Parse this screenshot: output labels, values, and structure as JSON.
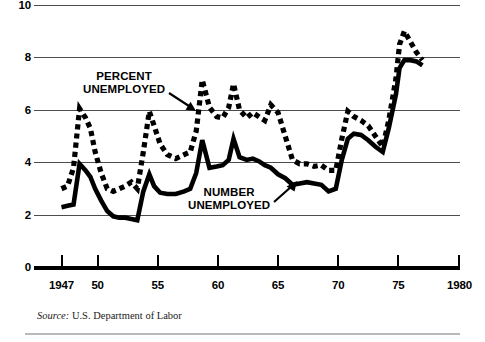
{
  "chart_data": {
    "type": "line",
    "title": "",
    "subtitle": "",
    "xlabel": "",
    "ylabel": "",
    "xlim": [
      1947,
      1980
    ],
    "ylim": [
      0,
      10
    ],
    "grid": true,
    "legend_position": "inline-annotations",
    "y_ticks": [
      10,
      8,
      6,
      4,
      2,
      0
    ],
    "y_tick_labels": [
      "10",
      "8",
      "6",
      "4",
      "2",
      "0"
    ],
    "x_ticks": [
      1947,
      1950,
      1955,
      1960,
      1965,
      1970,
      1975,
      1980
    ],
    "x_tick_labels": [
      "1947",
      "50",
      "55",
      "60",
      "65",
      "70",
      "75",
      "1980"
    ],
    "annotations": [
      {
        "text": "PERCENT UNEMPLOYED",
        "target_series": "PERCENT UNEMPLOYED",
        "arrow": "down-right"
      },
      {
        "text": "NUMBER UNEMPLOYED",
        "target_series": "NUMBER UNEMPLOYED",
        "arrow": "up-right"
      }
    ],
    "source": "U.S. Department of Labor",
    "x": [
      1947.0,
      1947.5,
      1948.0,
      1948.5,
      1949.0,
      1949.4,
      1949.8,
      1950.3,
      1950.8,
      1951.3,
      1951.8,
      1952.3,
      1952.8,
      1953.3,
      1953.8,
      1954.3,
      1954.7,
      1955.2,
      1955.8,
      1956.5,
      1957.2,
      1957.7,
      1958.2,
      1958.7,
      1959.3,
      1959.9,
      1960.4,
      1960.9,
      1961.3,
      1961.8,
      1962.4,
      1962.9,
      1963.4,
      1963.9,
      1964.4,
      1965.0,
      1965.6,
      1966.2,
      1966.8,
      1967.4,
      1968.0,
      1968.6,
      1969.2,
      1969.8,
      1970.3,
      1970.8,
      1971.3,
      1971.9,
      1972.5,
      1973.1,
      1973.7,
      1974.2,
      1974.8,
      1975.1,
      1975.5,
      1976.0,
      1976.5,
      1977.0
    ],
    "series": [
      {
        "name": "PERCENT UNEMPLOYED",
        "style": "dashed-heavy",
        "color": "#000000",
        "values": [
          3.0,
          3.1,
          3.8,
          6.05,
          5.7,
          5.3,
          4.4,
          3.6,
          3.0,
          2.9,
          3.0,
          3.1,
          3.25,
          3.0,
          4.4,
          5.95,
          5.4,
          4.7,
          4.3,
          4.15,
          4.3,
          4.4,
          5.2,
          7.15,
          6.1,
          5.75,
          5.7,
          6.1,
          7.0,
          6.0,
          5.7,
          5.9,
          5.75,
          5.6,
          6.2,
          5.9,
          5.0,
          4.1,
          3.95,
          3.95,
          3.85,
          3.9,
          3.7,
          3.7,
          4.9,
          5.95,
          5.75,
          5.6,
          5.4,
          5.0,
          4.6,
          5.6,
          7.2,
          8.5,
          9.0,
          8.6,
          8.2,
          7.9
        ]
      },
      {
        "name": "NUMBER UNEMPLOYED",
        "style": "solid-heavy",
        "color": "#000000",
        "values": [
          2.3,
          2.35,
          2.4,
          3.95,
          3.7,
          3.45,
          3.0,
          2.55,
          2.15,
          1.95,
          1.9,
          1.9,
          1.85,
          1.8,
          2.9,
          3.55,
          3.1,
          2.85,
          2.8,
          2.8,
          2.9,
          3.0,
          3.6,
          4.85,
          3.8,
          3.85,
          3.9,
          4.1,
          4.9,
          4.2,
          4.1,
          4.15,
          4.05,
          3.9,
          3.8,
          3.55,
          3.4,
          3.15,
          3.2,
          3.25,
          3.2,
          3.15,
          2.9,
          3.0,
          4.1,
          4.9,
          5.1,
          5.05,
          4.85,
          4.6,
          4.4,
          5.3,
          6.6,
          7.6,
          7.9,
          7.9,
          7.85,
          7.7
        ]
      }
    ]
  },
  "axis": {
    "y_labels": [
      "10",
      "8",
      "6",
      "4",
      "2",
      "0"
    ],
    "x_labels": [
      "1947",
      "50",
      "55",
      "60",
      "65",
      "70",
      "75",
      "1980"
    ]
  },
  "labels": {
    "percent_line1": "PERCENT",
    "percent_line2": "UNEMPLOYED",
    "number_line1": "NUMBER",
    "number_line2": "UNEMPLOYED"
  },
  "source": {
    "prefix": "Source:",
    "text": "U.S. Department of Labor"
  }
}
